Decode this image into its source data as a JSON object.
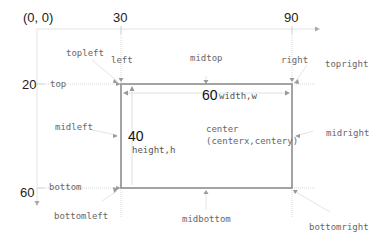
{
  "diagram": {
    "origin_label": "(0, 0)",
    "x_ticks": [
      {
        "label": "30"
      },
      {
        "label": "90"
      }
    ],
    "y_ticks": [
      {
        "label": "20"
      },
      {
        "label": "60"
      }
    ],
    "rect": {
      "left_value": 30,
      "top_value": 20,
      "width_value": "60",
      "height_value": "40",
      "width_label": "width,w",
      "height_label": "height,h",
      "border_color": "#888888"
    },
    "attributes": {
      "topleft": "topleft",
      "left": "left",
      "midtop": "midtop",
      "right": "right",
      "topright": "topright",
      "top": "top",
      "midleft": "midleft",
      "center": "center",
      "center_coords": "(centerx,centery)",
      "midright": "midright",
      "bottom": "bottom",
      "bottomleft": "bottomleft",
      "midbottom": "midbottom",
      "bottomright": "bottomright"
    },
    "colors": {
      "guide_line": "#dddddd",
      "axis_line": "#e2e2e2",
      "arrow": "#999999",
      "text": "#666666"
    }
  }
}
